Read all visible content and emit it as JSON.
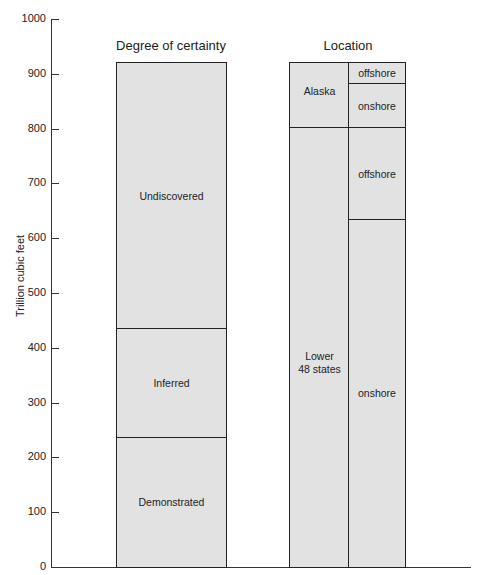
{
  "chart_data": {
    "type": "bar",
    "stacked": true,
    "ylabel": "Trillion cubic feet",
    "ylim": [
      0,
      1000
    ],
    "yticks": [
      0,
      100,
      200,
      300,
      400,
      500,
      600,
      700,
      800,
      900,
      1000
    ],
    "grid": false,
    "panels": [
      {
        "title": "Degree of certainty",
        "segments": [
          {
            "label": "Demonstrated",
            "from": 0,
            "to": 235
          },
          {
            "label": "Inferred",
            "from": 235,
            "to": 435
          },
          {
            "label": "Undiscovered",
            "from": 435,
            "to": 920
          }
        ]
      },
      {
        "title": "Location",
        "columns": [
          {
            "segments": [
              {
                "label": "Lower 48 states",
                "from": 0,
                "to": 800
              },
              {
                "label": "Alaska",
                "from": 800,
                "to": 920
              }
            ]
          },
          {
            "segments": [
              {
                "label": "onshore",
                "from": 0,
                "to": 633
              },
              {
                "label": "offshore",
                "from": 633,
                "to": 800
              },
              {
                "label": "onshore",
                "from": 800,
                "to": 880
              },
              {
                "label": "offshore",
                "from": 880,
                "to": 920
              }
            ]
          }
        ]
      }
    ]
  },
  "labels": {
    "ylabel": "Trillion cubic feet",
    "title_left": "Degree of certainty",
    "title_right": "Location",
    "ticks": [
      "0",
      "100",
      "200",
      "300",
      "400",
      "500",
      "600",
      "700",
      "800",
      "900",
      "1000"
    ],
    "demonstrated": "Demonstrated",
    "inferred": "Inferred",
    "undiscovered": "Undiscovered",
    "lower48_line1": "Lower",
    "lower48_line2": "48 states",
    "alaska": "Alaska",
    "onshore": "onshore",
    "offshore": "offshore"
  }
}
